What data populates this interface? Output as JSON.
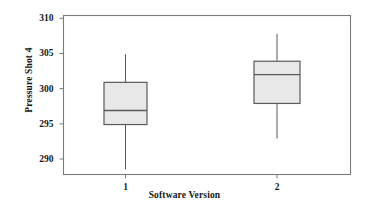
{
  "chart_data": {
    "type": "box",
    "title": "",
    "xlabel": "Software Version",
    "ylabel": "Pressure Shot 4",
    "categories": [
      "1",
      "2"
    ],
    "ylim": [
      287.8,
      310.4
    ],
    "yticks": [
      290,
      295,
      300,
      305,
      310
    ],
    "ytick_labels": [
      "290",
      "295",
      "300",
      "305",
      "310"
    ],
    "xtick_labels": [
      "1",
      "2"
    ],
    "grid": false,
    "legend": null,
    "box_fill_color": "#e8e8e8",
    "box_line_color": "#5a5a5a",
    "frame_color": "#7a7a7a",
    "boxes": [
      {
        "category": "1",
        "whisker_low": 288.5,
        "q1": 294.9,
        "median": 296.9,
        "q3": 300.9,
        "whisker_high": 304.9,
        "outliers": []
      },
      {
        "category": "2",
        "whisker_low": 292.9,
        "q1": 297.9,
        "median": 302.0,
        "q3": 303.9,
        "whisker_high": 307.8,
        "outliers": []
      }
    ]
  }
}
